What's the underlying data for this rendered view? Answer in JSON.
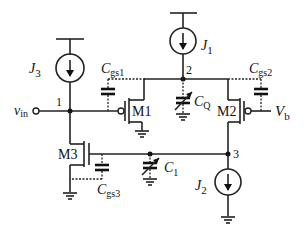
{
  "diagram": {
    "type": "circuit-schematic",
    "nodes": [
      {
        "id": "node-1",
        "label": "1"
      },
      {
        "id": "node-2",
        "label": "2"
      },
      {
        "id": "node-3",
        "label": "3"
      }
    ],
    "current_sources": [
      {
        "id": "J3",
        "main": "J",
        "sub": "3"
      },
      {
        "id": "J1",
        "main": "J",
        "sub": "1"
      },
      {
        "id": "J2",
        "main": "J",
        "sub": "2"
      }
    ],
    "transistors": [
      {
        "id": "M1",
        "label": "M1"
      },
      {
        "id": "M2",
        "label": "M2"
      },
      {
        "id": "M3",
        "label": "M3"
      }
    ],
    "capacitors": [
      {
        "id": "Cgs1",
        "main": "C",
        "sub": "gs1"
      },
      {
        "id": "Cgs2",
        "main": "C",
        "sub": "gs2"
      },
      {
        "id": "Cgs3",
        "main": "C",
        "sub": "gs3"
      },
      {
        "id": "CQ",
        "main": "C",
        "sub": "Q"
      },
      {
        "id": "C1",
        "main": "C",
        "sub": "1"
      }
    ],
    "ports": [
      {
        "id": "vin",
        "main": "v",
        "sub": "in"
      },
      {
        "id": "Vb",
        "main": "V",
        "sub": "b"
      }
    ]
  }
}
